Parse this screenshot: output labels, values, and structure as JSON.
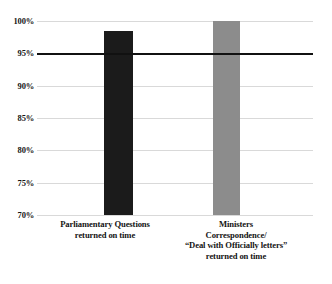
{
  "chart_data": {
    "type": "bar",
    "title": "",
    "subtitle": "",
    "xlabel": "",
    "ylabel": "",
    "ylim": [
      70,
      100
    ],
    "ytick_values": [
      100,
      95,
      90,
      85,
      80,
      75,
      70
    ],
    "ytick_labels": [
      "100%",
      "95%",
      "90%",
      "85%",
      "80%",
      "75%",
      "70%"
    ],
    "grid": true,
    "legend": "none",
    "categories": [
      "Parliamentary Questions returned on time",
      "Ministers Correspondence/ “Deal with Officially letters” returned on time"
    ],
    "values": [
      98.5,
      100
    ],
    "bar_colors": [
      "#1b1b1b",
      "#8c8c8c"
    ],
    "annotations": [
      {
        "name": "target-line",
        "value": 95,
        "label": "95%",
        "style": "heavy black horizontal line drawn across plot over the bars",
        "color": "#111111"
      }
    ]
  },
  "axes": {
    "y_ticks": [
      {
        "label": "100%",
        "value": 100
      },
      {
        "label": "95%",
        "value": 95
      },
      {
        "label": "90%",
        "value": 90
      },
      {
        "label": "85%",
        "value": 85
      },
      {
        "label": "80%",
        "value": 80
      },
      {
        "label": "75%",
        "value": 75
      },
      {
        "label": "70%",
        "value": 70
      }
    ]
  },
  "bars": [
    {
      "name": "parliamentary-questions",
      "value": 98.5,
      "color": "#1b1b1b",
      "label_lines": [
        "Parliamentary Questions",
        "returned on time"
      ]
    },
    {
      "name": "ministers-correspondence",
      "value": 100,
      "color": "#8c8c8c",
      "label_lines": [
        "Ministers",
        "Correspondence/",
        "“Deal with Officially letters”",
        "returned on time"
      ]
    }
  ],
  "colors": {
    "background": "#ffffff",
    "gridline": "#d9d9d9",
    "target_line": "#111111",
    "text": "#161616",
    "bar_dark": "#1b1b1b",
    "bar_gray": "#8c8c8c"
  }
}
